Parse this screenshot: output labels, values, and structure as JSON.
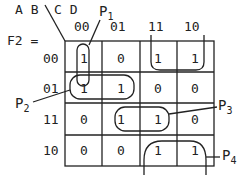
{
  "title": "F2 =",
  "variables": {
    "row": "A B",
    "col": "C D"
  },
  "col_labels": [
    "00",
    "01",
    "11",
    "10"
  ],
  "row_labels": [
    "00",
    "01",
    "11",
    "10"
  ],
  "cells": [
    [
      "1",
      "0",
      "1",
      "1"
    ],
    [
      "1",
      "1",
      "0",
      "0"
    ],
    [
      "0",
      "1",
      "1",
      "0"
    ],
    [
      "0",
      "0",
      "1",
      "1"
    ]
  ],
  "groups": {
    "p1": "P",
    "p1_sub": "1",
    "p2": "P",
    "p2_sub": "2",
    "p3": "P",
    "p3_sub": "3",
    "p4": "P",
    "p4_sub": "4"
  }
}
